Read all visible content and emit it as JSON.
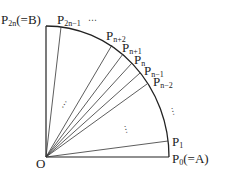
{
  "diagram": {
    "type": "quarter-circle sector subdivided into 2n equal arcs",
    "origin_label": "O",
    "labels": {
      "B": {
        "main": "P",
        "sub": "2n",
        "suffix": "(=B)"
      },
      "P2n_minus_1": {
        "main": "P",
        "sub": "2n−1"
      },
      "Pn_plus_2": {
        "main": "P",
        "sub": "n+2"
      },
      "Pn_plus_1": {
        "main": "P",
        "sub": "n+1"
      },
      "Pn": {
        "main": "P",
        "sub": "n"
      },
      "Pn_minus_1": {
        "main": "P",
        "sub": "n−1"
      },
      "Pn_minus_2": {
        "main": "P",
        "sub": "n−2"
      },
      "P1": {
        "main": "P",
        "sub": "1"
      },
      "A": {
        "main": "P",
        "sub": "0",
        "suffix": "(=A)"
      }
    },
    "ellipsis": "⋯",
    "colors": {
      "stroke": "#222222",
      "background": "#ffffff"
    }
  }
}
